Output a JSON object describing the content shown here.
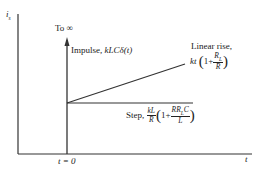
{
  "diagram": {
    "y_axis_label": "i",
    "y_axis_label_sub": "s",
    "x_axis_label": "t",
    "t0_label": "t = 0",
    "impulse_top_label": "To ∞",
    "impulse_label_prefix": "Impulse, ",
    "impulse_label_expr": "kLCδ(t)",
    "linear_label_line1": "Linear rise,",
    "linear_label_kt": "kt",
    "linear_label_one_plus": "1+",
    "linear_frac_num": "R",
    "linear_frac_num_sub": "L",
    "linear_frac_den": "R",
    "step_label_prefix": "Step, ",
    "step_frac1_num": "kL",
    "step_frac1_den": "R",
    "step_one_plus": "1+",
    "step_frac2_num": "RR",
    "step_frac2_num_sub": "L",
    "step_frac2_num_tail": "C",
    "step_frac2_den": "L",
    "line_color": "#333333"
  }
}
